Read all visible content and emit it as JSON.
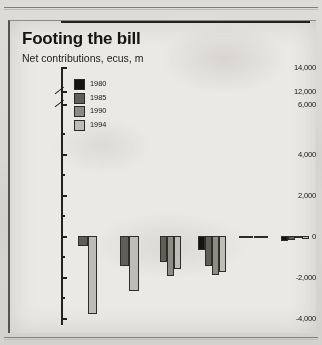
{
  "figure": {
    "title": "Footing the bill",
    "subtitle": "Net contributions, ecus, m"
  },
  "legend": {
    "items": [
      {
        "label": "1980",
        "color": "#141410"
      },
      {
        "label": "1985",
        "color": "#5f5e57"
      },
      {
        "label": "1990",
        "color": "#8d8c84"
      },
      {
        "label": "1994",
        "color": "#bebdb5"
      }
    ]
  },
  "chart_data": {
    "type": "bar",
    "title": "Footing the bill",
    "subtitle": "Net contributions, ecus, m",
    "xlabel": "",
    "ylabel": "",
    "unit": "ecus, m",
    "grid": false,
    "legend_position": "top-left",
    "axis_broken": true,
    "ylim": [
      -4000,
      14000
    ],
    "ytick_labels": [
      "14,000",
      "12,000",
      "6,000",
      "4,000",
      "2,000",
      "0",
      "-2,000",
      "-4,000"
    ],
    "ytick_values": [
      14000,
      12000,
      6000,
      4000,
      2000,
      0,
      -2000,
      -4000
    ],
    "categories": [
      "Portugal",
      "Spain",
      "Greece",
      "Ireland",
      "Luxembourg",
      "Denmark"
    ],
    "categories_clipped": [
      "Portugal",
      "Spain",
      "Greece",
      "Ireland",
      "Luxembourg",
      "Denma"
    ],
    "series": [
      {
        "name": "1980",
        "color": "#141410",
        "values": [
          null,
          null,
          null,
          -700,
          -60,
          -230
        ]
      },
      {
        "name": "1985",
        "color": "#5f5e57",
        "values": [
          -500,
          -1450,
          -1250,
          -1450,
          -70,
          -180
        ]
      },
      {
        "name": "1990",
        "color": "#8d8c84",
        "values": [
          null,
          null,
          -1950,
          -1900,
          -90,
          -120
        ]
      },
      {
        "name": "1994",
        "color": "#bebdb5",
        "values": [
          -3800,
          -2700,
          -1600,
          -1750,
          -110,
          -140
        ]
      }
    ]
  },
  "ticks": [
    {
      "label": "14,000",
      "top": 46
    },
    {
      "label": "12,000",
      "top": 70
    },
    {
      "label": "6,000",
      "top": 83
    },
    {
      "label": "4,000",
      "top": 133
    },
    {
      "label": "2,000",
      "top": 174
    },
    {
      "label": "0",
      "top": 215
    },
    {
      "label": "-2,000",
      "top": 256
    },
    {
      "label": "-4,000",
      "top": 297
    }
  ]
}
